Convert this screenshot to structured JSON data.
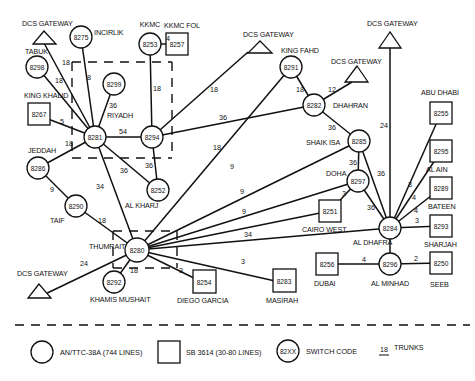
{
  "diagram": {
    "gateway_label": "DCS GATEWAY",
    "gateways": [
      {
        "id": "gw1",
        "label": "DCS GATEWAY",
        "x": 44,
        "y": 41
      },
      {
        "id": "gw2",
        "label": "DCS GATEWAY",
        "x": 248,
        "y": 48
      },
      {
        "id": "gw3",
        "label": "DCS GATEWAY",
        "x": 356,
        "y": 77
      },
      {
        "id": "gw4",
        "label": "DCS GATEWAY",
        "x": 390,
        "y": 44
      },
      {
        "id": "gw5",
        "label": "DCS GATEWAY",
        "x": 39,
        "y": 297
      }
    ],
    "circle_nodes": [
      {
        "code": "8275",
        "label": "INCIRLIK",
        "x": 81,
        "y": 37
      },
      {
        "code": "8253",
        "label": "KKMC",
        "x": 150,
        "y": 44
      },
      {
        "code": "8298",
        "label": "TABUK",
        "x": 37,
        "y": 67
      },
      {
        "code": "8299",
        "label": "",
        "x": 114,
        "y": 84
      },
      {
        "code": "8281",
        "label": "",
        "x": 95,
        "y": 137
      },
      {
        "code": "8294",
        "label": "",
        "x": 152,
        "y": 137
      },
      {
        "code": "8286",
        "label": "JEDDAH",
        "x": 38,
        "y": 168
      },
      {
        "code": "8252",
        "label": "AL KHARJ",
        "x": 158,
        "y": 190
      },
      {
        "code": "8290",
        "label": "TAIF",
        "x": 76,
        "y": 206
      },
      {
        "code": "8280",
        "label": "THUMRAIT",
        "x": 137,
        "y": 250
      },
      {
        "code": "8292",
        "label": "KHAMIS MUSHAIT",
        "x": 114,
        "y": 282
      },
      {
        "code": "8291",
        "label": "KING FAHD",
        "x": 291,
        "y": 67
      },
      {
        "code": "8282",
        "label": "DHAHRAN",
        "x": 314,
        "y": 105
      },
      {
        "code": "8285",
        "label": "SHAIK ISA",
        "x": 359,
        "y": 141
      },
      {
        "code": "8297",
        "label": "DOHA",
        "x": 358,
        "y": 181
      },
      {
        "code": "8284",
        "label": "AL DHAFRA",
        "x": 390,
        "y": 228
      },
      {
        "code": "8296",
        "label": "AL MINHAD",
        "x": 390,
        "y": 264
      }
    ],
    "square_nodes": [
      {
        "code": "8257",
        "label": "KKMC FOL",
        "x": 176,
        "y": 44
      },
      {
        "code": "8267",
        "label": "KING KHALID",
        "x": 35,
        "y": 114
      },
      {
        "code": "8251",
        "label": "CAIRO WEST",
        "x": 330,
        "y": 211
      },
      {
        "code": "8254",
        "label": "DIEGO GARCIA",
        "x": 204,
        "y": 283
      },
      {
        "code": "8283",
        "label": "MASIRAH",
        "x": 284,
        "y": 283
      },
      {
        "code": "8256",
        "label": "DUBAI",
        "x": 327,
        "y": 264
      },
      {
        "code": "8250",
        "label": "SEEB",
        "x": 441,
        "y": 263
      },
      {
        "code": "8255",
        "label": "ABU DHABI",
        "x": 441,
        "y": 113
      },
      {
        "code": "8295",
        "label": "AL AIN",
        "x": 441,
        "y": 151
      },
      {
        "code": "8289",
        "label": "BATEEN",
        "x": 441,
        "y": 188
      },
      {
        "code": "8293",
        "label": "SHARJAH",
        "x": 441,
        "y": 226
      }
    ],
    "regions": [
      {
        "label": "RIYADH"
      },
      {
        "label": "THUMRAIT"
      }
    ],
    "trunks": [
      {
        "from": "gw1",
        "to": "8281",
        "trunks": "18"
      },
      {
        "from": "8275",
        "to": "8281",
        "trunks": "8"
      },
      {
        "from": "8298",
        "to": "8281",
        "trunks": "18"
      },
      {
        "from": "8299",
        "to": "8281",
        "trunks": "36"
      },
      {
        "from": "8267",
        "to": "8281",
        "trunks": "5"
      },
      {
        "from": "8286",
        "to": "8281",
        "trunks": "18"
      },
      {
        "from": "8281",
        "to": "8294",
        "trunks": "54"
      },
      {
        "from": "8253",
        "to": "8294",
        "trunks": "18"
      },
      {
        "from": "8253",
        "to": "8257",
        "trunks": "4"
      },
      {
        "from": "8281",
        "to": "8252",
        "trunks": "36"
      },
      {
        "from": "8294",
        "to": "8252",
        "trunks": "36"
      },
      {
        "from": "8281",
        "to": "8280",
        "trunks": "34"
      },
      {
        "from": "8286",
        "to": "8290",
        "trunks": "9"
      },
      {
        "from": "8290",
        "to": "8280",
        "trunks": "18"
      },
      {
        "from": "8294",
        "to": "gw2",
        "trunks": "18"
      },
      {
        "from": "8294",
        "to": "8282",
        "trunks": "36"
      },
      {
        "from": "8291",
        "to": "8282",
        "trunks": "18"
      },
      {
        "from": "8282",
        "to": "gw3",
        "trunks": "12"
      },
      {
        "from": "8282",
        "to": "8285",
        "trunks": "36"
      },
      {
        "from": "8285",
        "to": "8297",
        "trunks": "36"
      },
      {
        "from": "8285",
        "to": "8284",
        "trunks": "36"
      },
      {
        "from": "8297",
        "to": "8284",
        "trunks": "36"
      },
      {
        "from": "8297",
        "to": "8251",
        "trunks": "3"
      },
      {
        "from": "gw4",
        "to": "8284",
        "trunks": "24"
      },
      {
        "from": "8280",
        "to": "8291",
        "trunks": "18"
      },
      {
        "from": "8280",
        "to": "8285",
        "trunks": "9"
      },
      {
        "from": "8280",
        "to": "8297",
        "trunks": "9"
      },
      {
        "from": "8280",
        "to": "8251",
        "trunks": "9"
      },
      {
        "from": "8280",
        "to": "8284",
        "trunks": "34"
      },
      {
        "from": "8280",
        "to": "8283",
        "trunks": "3"
      },
      {
        "from": "8280",
        "to": "8254",
        "trunks": "3"
      },
      {
        "from": "8280",
        "to": "8292",
        "trunks": "18"
      },
      {
        "from": "8280",
        "to": "gw5",
        "trunks": "24"
      },
      {
        "from": "8284",
        "to": "8255",
        "trunks": "3"
      },
      {
        "from": "8284",
        "to": "8295",
        "trunks": "4"
      },
      {
        "from": "8284",
        "to": "8289",
        "trunks": "4"
      },
      {
        "from": "8284",
        "to": "8293",
        "trunks": "3"
      },
      {
        "from": "8284",
        "to": "8296",
        "trunks": ""
      },
      {
        "from": "8296",
        "to": "8256",
        "trunks": "4"
      },
      {
        "from": "8296",
        "to": "8250",
        "trunks": "2"
      }
    ]
  },
  "labels": {
    "riyadh": "RIYADH",
    "incirlik": "INCIRLIK",
    "kkmc": "KKMC",
    "kkmc_fol": "KKMC FOL",
    "tabuk": "TABUK",
    "king_khalid": "KING KHALID",
    "jeddah": "JEDDAH",
    "taif": "TAIF",
    "al_kharj": "AL KHARJ",
    "thumrait": "THUMRAIT",
    "khamis_mushait": "KHAMIS MUSHAIT",
    "diego_garcia": "DIEGO GARCIA",
    "masirah": "MASIRAH",
    "king_fahd": "KING FAHD",
    "dhahran": "DHAHRAN",
    "shaik_isa": "SHAIK ISA",
    "doha": "DOHA",
    "cairo_west": "CAIRO WEST",
    "al_dhafra": "AL DHAFRA",
    "dubai": "DUBAI",
    "al_minhad": "AL MINHAD",
    "seeb": "SEEB",
    "abu_dhabi": "ABU DHABI",
    "al_ain": "AL AIN",
    "bateen": "BATEEN",
    "sharjah": "SHARJAH",
    "gateway": "DCS GATEWAY"
  },
  "codes": {
    "c8275": "8275",
    "c8253": "8253",
    "c8257": "8257",
    "c8298": "8298",
    "c8299": "8299",
    "c8267": "8267",
    "c8281": "8281",
    "c8294": "8294",
    "c8286": "8286",
    "c8252": "8252",
    "c8290": "8290",
    "c8280": "8280",
    "c8292": "8292",
    "c8254": "8254",
    "c8283": "8283",
    "c8291": "8291",
    "c8282": "8282",
    "c8285": "8285",
    "c8297": "8297",
    "c8251": "8251",
    "c8284": "8284",
    "c8296": "8296",
    "c8256": "8256",
    "c8250": "8250",
    "c8255": "8255",
    "c8295": "8295",
    "c8289": "8289",
    "c8293": "8293"
  },
  "trunk_labels": {
    "t18": "18",
    "t8": "8",
    "t36": "36",
    "t5": "5",
    "t54": "54",
    "t4": "4",
    "t34": "34",
    "t9": "9",
    "t12": "12",
    "t24": "24",
    "t3": "3",
    "t2": "2"
  },
  "legend": {
    "circle": "AN/TTC-38A (744 LINES)",
    "square": "SB 3614 (30-80 LINES)",
    "switch_code_symbol": "82XX",
    "switch_code": "SWITCH CODE",
    "trunks_example": "18",
    "trunks": "TRUNKS"
  }
}
